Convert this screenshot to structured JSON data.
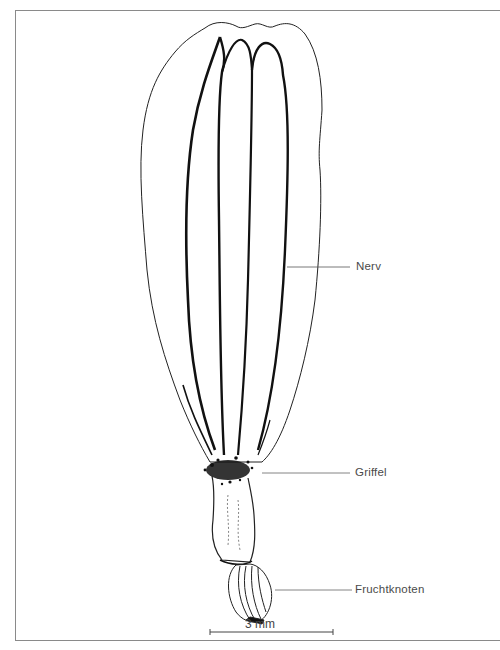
{
  "figure": {
    "labels": [
      {
        "id": "nerv",
        "text": "Nerv"
      },
      {
        "id": "griffel",
        "text": "Griffel"
      },
      {
        "id": "fruchtknoten",
        "text": "Fruchtknoten"
      }
    ],
    "scale_bar": {
      "text": "3 mm"
    }
  }
}
